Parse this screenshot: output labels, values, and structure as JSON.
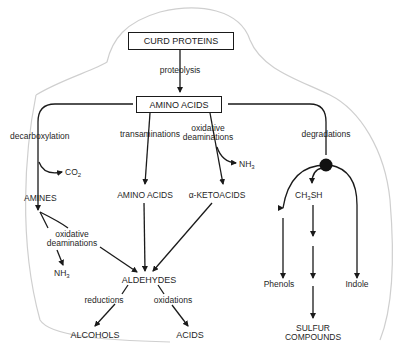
{
  "diagram": {
    "nodes": {
      "curd_proteins": "CURD PROTEINS",
      "amino_acids_top": "AMINO ACIDS",
      "amines": "AMINES",
      "amino_acids_mid": "AMINO ACIDS",
      "ketoacids": "α-KETOACIDS",
      "ch3sh_main": "CH",
      "ch3sh_sub": "3",
      "ch3sh_end": "SH",
      "aldehydes": "ALDEHYDES",
      "alcohols": "ALCOHOLS",
      "acids": "ACIDS",
      "phenols": "Phenols",
      "indole": "Indole",
      "sulfur_line1": "SULFUR",
      "sulfur_line2": "COMPOUNDS",
      "co2_main": "CO",
      "co2_sub": "2",
      "nh3_a_main": "NH",
      "nh3_a_sub": "3",
      "nh3_b_main": "NH",
      "nh3_b_sub": "3"
    },
    "processes": {
      "proteolysis": "proteolysis",
      "decarboxylation": "decarboxylation",
      "transaminations": "transaminations",
      "oxidative_deam_top_1": "oxidative",
      "oxidative_deam_top_2": "deaminations",
      "degradations": "degradations",
      "oxidative_deam_left_1": "oxidative",
      "oxidative_deam_left_2": "deaminations",
      "reductions": "reductions",
      "oxidations": "oxidations"
    }
  }
}
